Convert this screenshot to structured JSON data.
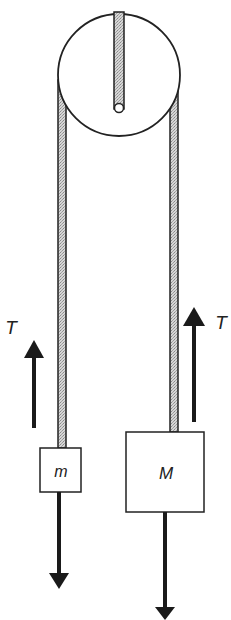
{
  "diagram": {
    "type": "atwood-machine",
    "colors": {
      "stroke": "#222222",
      "rope_fill": "#c8c8c8",
      "background": "#ffffff",
      "arrow": "#1a1a1a"
    },
    "pulley": {
      "label": ""
    },
    "masses": [
      {
        "id": "small",
        "label": "m"
      },
      {
        "id": "large",
        "label": "M"
      }
    ],
    "forces": [
      {
        "id": "tension-left",
        "label": "T",
        "direction": "up"
      },
      {
        "id": "tension-right",
        "label": "T",
        "direction": "up"
      },
      {
        "id": "weight-small",
        "label": "",
        "direction": "down"
      },
      {
        "id": "weight-large",
        "label": "",
        "direction": "down"
      }
    ]
  }
}
